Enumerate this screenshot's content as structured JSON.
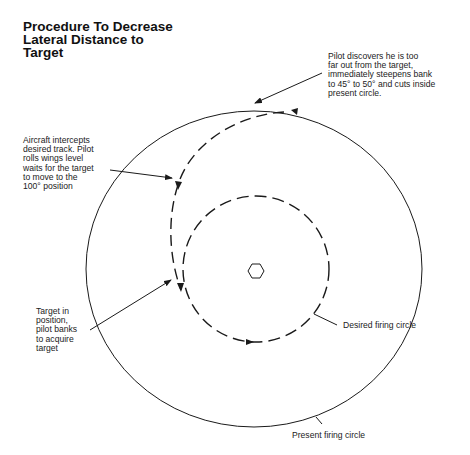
{
  "title": {
    "lines": [
      "Procedure To Decrease",
      "Lateral Distance to",
      "Target"
    ]
  },
  "annotations": {
    "pilot_discovers": {
      "lines": [
        "Pilot discovers he is too",
        "far out from the target,",
        "immediately steepens bank",
        "to 45° to 50° and cuts inside",
        "present circle."
      ]
    },
    "aircraft_intercepts": {
      "lines": [
        "Aircraft intercepts",
        "desired track. Pilot",
        "rolls wings level",
        "waits for the target",
        "to move to the",
        "100° position"
      ]
    },
    "target_in_position": {
      "lines": [
        "Target in",
        "position,",
        "pilot banks",
        "to acquire",
        "target"
      ]
    },
    "desired_firing_circle": {
      "label": "Desired firing circle"
    },
    "present_firing_circle": {
      "label": "Present firing circle"
    }
  },
  "diagram": {
    "present_circle": {
      "cx": 254,
      "cy": 269,
      "rx": 168,
      "ry": 158,
      "style": "solid"
    },
    "desired_circle": {
      "cx": 256,
      "cy": 269,
      "r": 73,
      "style": "dashed"
    },
    "target_marker": {
      "shape": "hexagon",
      "cx": 256,
      "cy": 271,
      "r": 8
    },
    "line_color": "#1a1a1a"
  }
}
